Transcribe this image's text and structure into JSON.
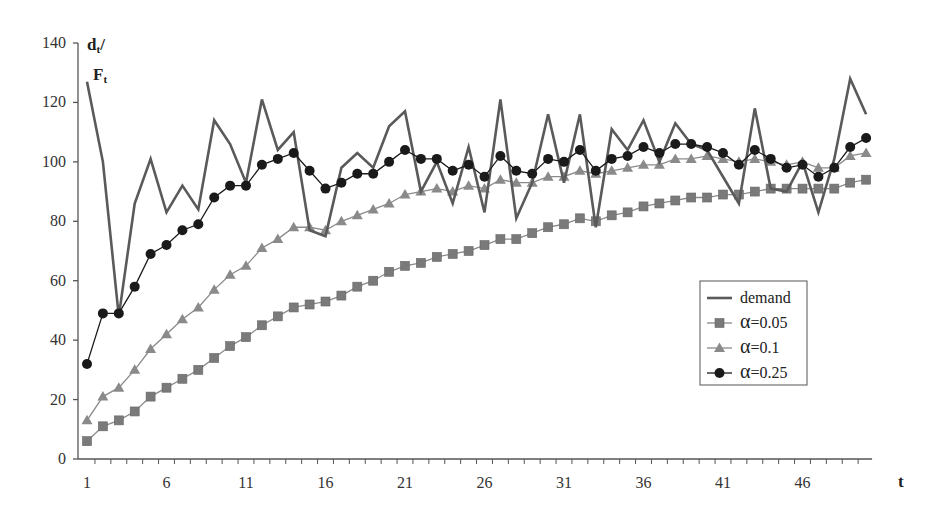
{
  "chart_data": {
    "type": "line",
    "title": "",
    "xlabel": "t",
    "ylabel": "dt/Ft",
    "ylabel_parts": {
      "line1": "d",
      "line1_sub": "t",
      "line1_suffix": "/",
      "line2": "F",
      "line2_sub": "t"
    },
    "ylim": [
      0,
      140
    ],
    "yticks": [
      0,
      20,
      40,
      60,
      80,
      100,
      120,
      140
    ],
    "xlim": [
      1,
      50
    ],
    "xtick_labels": [
      1,
      6,
      11,
      16,
      21,
      26,
      31,
      36,
      41,
      46
    ],
    "grid": false,
    "legend_position": "right-center",
    "x": [
      1,
      2,
      3,
      4,
      5,
      6,
      7,
      8,
      9,
      10,
      11,
      12,
      13,
      14,
      15,
      16,
      17,
      18,
      19,
      20,
      21,
      22,
      23,
      24,
      25,
      26,
      27,
      28,
      29,
      30,
      31,
      32,
      33,
      34,
      35,
      36,
      37,
      38,
      39,
      40,
      41,
      42,
      43,
      44,
      45,
      46,
      47,
      48,
      49,
      50
    ],
    "series": [
      {
        "name": "demand",
        "marker": "none",
        "color": "#5a5a5a",
        "values": [
          127,
          100,
          48,
          86,
          101,
          83,
          92,
          84,
          114,
          106,
          93,
          121,
          104,
          110,
          77,
          75,
          98,
          103,
          98,
          112,
          117,
          90,
          100,
          86,
          105,
          83,
          121,
          81,
          93,
          116,
          93,
          116,
          78,
          111,
          104,
          114,
          100,
          113,
          106,
          104,
          95,
          86,
          118,
          91,
          90,
          100,
          83,
          101,
          128,
          116
        ]
      },
      {
        "name": "α=0.05",
        "marker": "square",
        "color": "#7a7a7a",
        "values": [
          6,
          11,
          13,
          16,
          21,
          24,
          27,
          30,
          34,
          38,
          41,
          45,
          48,
          51,
          52,
          53,
          55,
          58,
          60,
          63,
          65,
          66,
          68,
          69,
          70,
          72,
          74,
          74,
          76,
          78,
          79,
          81,
          80,
          82,
          83,
          85,
          86,
          87,
          88,
          88,
          89,
          89,
          90,
          91,
          91,
          91,
          91,
          91,
          93,
          94
        ]
      },
      {
        "name": "α=0.1",
        "marker": "triangle",
        "color": "#8a8a8a",
        "values": [
          13,
          21,
          24,
          30,
          37,
          42,
          47,
          51,
          57,
          62,
          65,
          71,
          74,
          78,
          78,
          77,
          80,
          82,
          84,
          86,
          89,
          90,
          91,
          90,
          92,
          91,
          94,
          93,
          93,
          95,
          95,
          97,
          96,
          97,
          98,
          99,
          99,
          101,
          101,
          102,
          101,
          100,
          101,
          100,
          99,
          100,
          98,
          98,
          102,
          103
        ]
      },
      {
        "name": "α=0.25",
        "marker": "circle",
        "color": "#1a1a1a",
        "values": [
          32,
          49,
          49,
          58,
          69,
          72,
          77,
          79,
          88,
          92,
          92,
          99,
          101,
          103,
          97,
          91,
          93,
          96,
          96,
          100,
          104,
          101,
          101,
          97,
          99,
          95,
          102,
          97,
          96,
          101,
          100,
          104,
          97,
          101,
          102,
          105,
          103,
          106,
          106,
          105,
          103,
          99,
          104,
          101,
          98,
          99,
          95,
          98,
          105,
          108
        ]
      }
    ]
  }
}
